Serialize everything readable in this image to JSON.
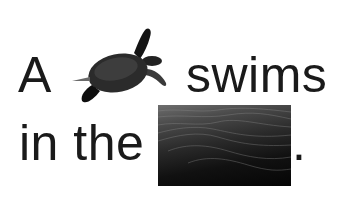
{
  "sentence": {
    "word1": "A",
    "image1": {
      "icon": "sea-turtle-image",
      "alt": "sea turtle"
    },
    "word2": "swims",
    "word3": "in the",
    "image2": {
      "icon": "ocean-water-image",
      "alt": "ocean water"
    },
    "word4": "."
  }
}
